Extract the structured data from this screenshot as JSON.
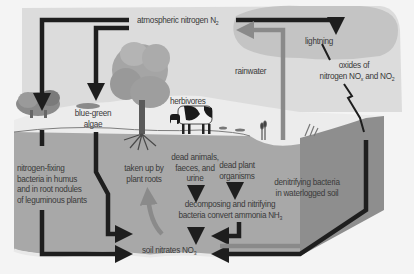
{
  "diagram": {
    "colors": {
      "sky": "#dcdcdc",
      "cloud": "#c6c6c6",
      "ground_surface": "#e9e9e9",
      "soil": "#a9a9a9",
      "soil_side": "#8e8e8e",
      "arrow_dark": "#1e1e1e",
      "arrow_light": "#8a8a8a"
    },
    "labels": {
      "atmospheric": {
        "text": "atmospheric nitrogen N",
        "sub": "2"
      },
      "lightning": "lightning",
      "oxides": {
        "line1": "oxides of",
        "line2_a": "nitrogen NO",
        "line2_sub1": "x",
        "line2_b": " and NO",
        "line2_sub2": "2"
      },
      "rainwater": "rainwater",
      "herbivores": "herbivores",
      "blue_green_algae": {
        "line1": "blue-green",
        "line2": "algae"
      },
      "nitrogen_fixing": {
        "line1": "nitrogen-fixing",
        "line2": "bacteria in humus",
        "line3": "and in root nodules",
        "line4": "of leguminous plants"
      },
      "taken_up": {
        "line1": "taken up by",
        "line2": "plant roots"
      },
      "dead_animals": {
        "line1": "dead animals,",
        "line2": "faeces, and",
        "line3": "urine"
      },
      "dead_plant": {
        "line1": "dead plant",
        "line2": "organisms"
      },
      "decomposing": {
        "line1": "decomposing and nitrifying",
        "line2": "bacteria convert ammonia NH",
        "sub": "3"
      },
      "denitrifying": {
        "line1": "denitrifying bacteria",
        "line2": "in waterlogged soil"
      },
      "soil_nitrates": {
        "text": "soil nitrates NO",
        "sub": "3"
      }
    },
    "flows": [
      {
        "from": "atmospheric nitrogen N2",
        "to": "nitrogen-fixing bacteria",
        "style": "dark"
      },
      {
        "from": "atmospheric nitrogen N2",
        "to": "blue-green algae",
        "style": "dark"
      },
      {
        "from": "atmospheric nitrogen N2",
        "to": "lightning",
        "style": "dark"
      },
      {
        "from": "lightning",
        "to": "oxides of nitrogen",
        "style": "zigzag"
      },
      {
        "from": "nitrogen-fixing bacteria",
        "to": "soil nitrates NO3",
        "style": "dark"
      },
      {
        "from": "blue-green algae",
        "to": "soil nitrates NO3",
        "style": "dark"
      },
      {
        "from": "soil nitrates NO3",
        "to": "plant roots",
        "style": "light"
      },
      {
        "from": "dead animals, faeces, and urine",
        "to": "decomposing bacteria",
        "style": "dark"
      },
      {
        "from": "dead plant organisms",
        "to": "decomposing bacteria",
        "style": "dark"
      },
      {
        "from": "decomposing bacteria",
        "to": "soil nitrates NO3",
        "style": "dark"
      },
      {
        "from": "oxides of nitrogen",
        "to": "soil nitrates NO3",
        "style": "dark"
      },
      {
        "from": "denitrifying bacteria",
        "to": "atmospheric nitrogen N2",
        "style": "light"
      },
      {
        "from": "rainwater",
        "to": "soil nitrates NO3",
        "style": "light"
      }
    ]
  }
}
